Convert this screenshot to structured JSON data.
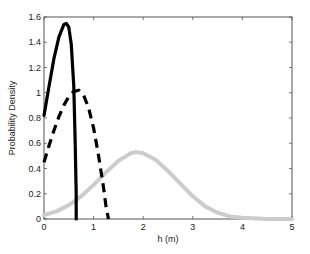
{
  "chart_data": {
    "type": "line",
    "title": "",
    "xlabel": "h (m)",
    "ylabel": "Probability Density",
    "xlim": [
      0,
      5
    ],
    "ylim": [
      0,
      1.6
    ],
    "xticks": [
      0,
      1,
      2,
      3,
      4,
      5
    ],
    "yticks": [
      0,
      0.2,
      0.4,
      0.6,
      0.8,
      1,
      1.2,
      1.4,
      1.6
    ],
    "ytick_labels": [
      "0",
      "0.2",
      "0.4",
      "0.6",
      "0.8",
      "1",
      "1.2",
      "1.4",
      "1.6"
    ],
    "grid": false,
    "legend": null,
    "series": [
      {
        "name": "solid",
        "style": "solid",
        "color": "#000000",
        "x": [
          0,
          0.1,
          0.2,
          0.3,
          0.4,
          0.45,
          0.5,
          0.55,
          0.6,
          0.63,
          0.65,
          0.65
        ],
        "y": [
          0.82,
          1.05,
          1.27,
          1.44,
          1.54,
          1.55,
          1.52,
          1.38,
          1.05,
          0.6,
          0.2,
          0
        ]
      },
      {
        "name": "dashed",
        "style": "dashed",
        "color": "#000000",
        "x": [
          0,
          0.1,
          0.2,
          0.3,
          0.4,
          0.5,
          0.6,
          0.7,
          0.8,
          0.9,
          1.0,
          1.1,
          1.2,
          1.25,
          1.3
        ],
        "y": [
          0.45,
          0.58,
          0.7,
          0.81,
          0.9,
          0.97,
          1.01,
          1.02,
          0.98,
          0.88,
          0.72,
          0.5,
          0.25,
          0.1,
          0
        ]
      },
      {
        "name": "gray",
        "style": "solid",
        "color": "#cccccc",
        "x": [
          0,
          0.25,
          0.5,
          0.75,
          1.0,
          1.25,
          1.5,
          1.75,
          1.85,
          2.0,
          2.25,
          2.5,
          2.75,
          3.0,
          3.25,
          3.5,
          3.75,
          4.0,
          4.5,
          5.0
        ],
        "y": [
          0.03,
          0.06,
          0.11,
          0.18,
          0.27,
          0.37,
          0.46,
          0.52,
          0.53,
          0.52,
          0.47,
          0.38,
          0.28,
          0.18,
          0.1,
          0.05,
          0.02,
          0.01,
          0.0,
          0.0
        ]
      }
    ]
  },
  "axes": {
    "xlabel": "h (m)",
    "ylabel": "Probability Density",
    "xtick_labels": [
      "0",
      "1",
      "2",
      "3",
      "4",
      "5"
    ],
    "ytick_labels": [
      "0",
      "0.2",
      "0.4",
      "0.6",
      "0.8",
      "1",
      "1.2",
      "1.4",
      "1.6"
    ]
  }
}
